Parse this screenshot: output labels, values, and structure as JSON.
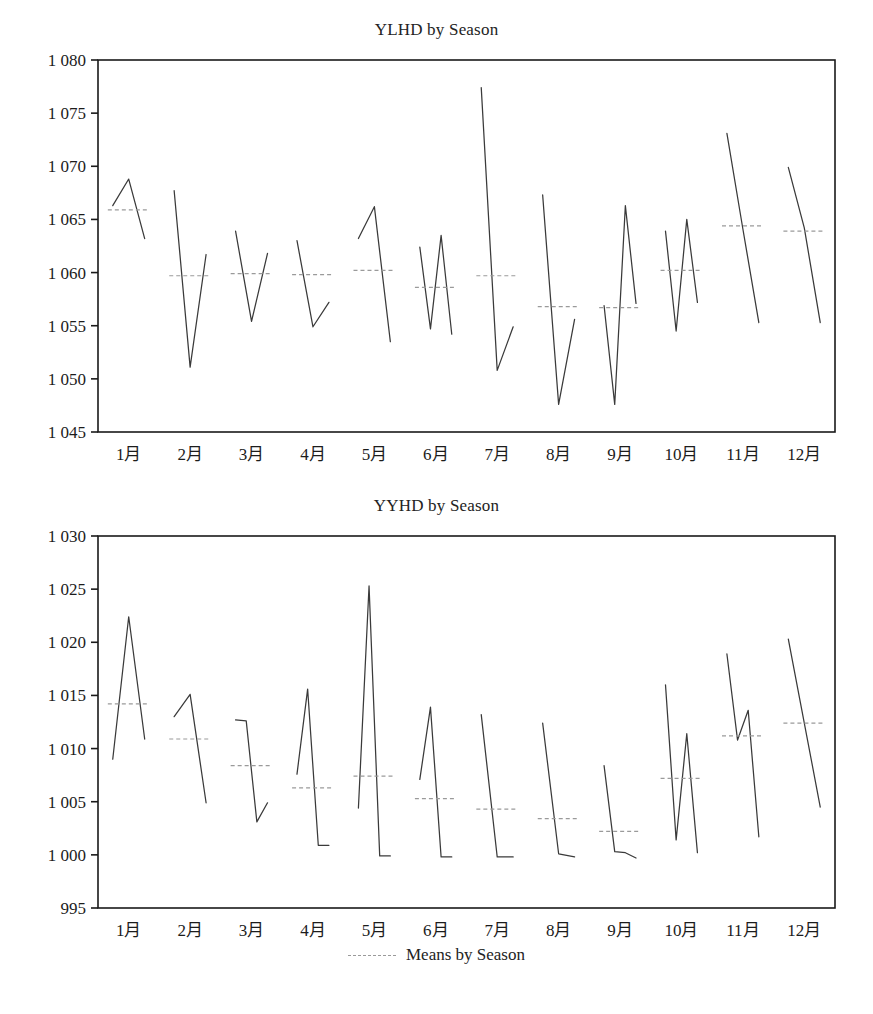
{
  "figure": {
    "legend_label": "Means by Season",
    "legend_swatch_name": "dashed-line-swatch",
    "series_color": "#3a3a3a",
    "mean_color": "#9a9a9a",
    "axis_color": "#1a1a1a",
    "background": "#ffffff"
  },
  "chart_data": [
    {
      "type": "line",
      "title": "YLHD by Season",
      "xlabel": "",
      "ylabel": "",
      "grid": false,
      "legend_position": "bottom",
      "legend_entries": [
        "Means by Season"
      ],
      "categories": [
        "1月",
        "2月",
        "3月",
        "4月",
        "5月",
        "6月",
        "7月",
        "8月",
        "9月",
        "10月",
        "11月",
        "12月"
      ],
      "ylim": [
        1045,
        1080
      ],
      "yticks": [
        1045,
        1050,
        1055,
        1060,
        1065,
        1070,
        1075,
        1080
      ],
      "ytick_labels": [
        "1 045",
        "1 050",
        "1 055",
        "1 060",
        "1 065",
        "1 070",
        "1 075",
        "1 080"
      ],
      "groups": [
        {
          "category": "1月",
          "values": [
            1066.3,
            1068.8,
            1063.2
          ],
          "mean": 1065.9
        },
        {
          "category": "2月",
          "values": [
            1067.7,
            1051.1,
            1061.7
          ],
          "mean": 1059.7
        },
        {
          "category": "3月",
          "values": [
            1063.9,
            1055.4,
            1061.8
          ],
          "mean": 1059.9
        },
        {
          "category": "4月",
          "values": [
            1063.0,
            1054.9,
            1057.2
          ],
          "mean": 1059.8
        },
        {
          "category": "5月",
          "values": [
            1063.2,
            1066.2,
            1053.5
          ],
          "mean": 1060.2
        },
        {
          "category": "6月",
          "values": [
            1062.4,
            1054.7,
            1063.5,
            1054.2
          ],
          "mean": 1058.6
        },
        {
          "category": "7月",
          "values": [
            1077.4,
            1050.8,
            1054.9
          ],
          "mean": 1059.7
        },
        {
          "category": "8月",
          "values": [
            1067.3,
            1047.6,
            1055.6
          ],
          "mean": 1056.8
        },
        {
          "category": "9月",
          "values": [
            1056.9,
            1047.6,
            1066.3,
            1057.1
          ],
          "mean": 1056.7
        },
        {
          "category": "10月",
          "values": [
            1063.9,
            1054.5,
            1065.0,
            1057.2
          ],
          "mean": 1060.2
        },
        {
          "category": "11月",
          "values": [
            1073.1,
            1064.1,
            1055.3
          ],
          "mean": 1064.4
        },
        {
          "category": "12月",
          "values": [
            1069.9,
            1064.2,
            1055.3
          ],
          "mean": 1063.9
        }
      ]
    },
    {
      "type": "line",
      "title": "YYHD by Season",
      "xlabel": "",
      "ylabel": "",
      "grid": false,
      "legend_position": "bottom",
      "legend_entries": [
        "Means by Season"
      ],
      "categories": [
        "1月",
        "2月",
        "3月",
        "4月",
        "5月",
        "6月",
        "7月",
        "8月",
        "9月",
        "10月",
        "11月",
        "12月"
      ],
      "ylim": [
        995,
        1030
      ],
      "yticks": [
        995,
        1000,
        1005,
        1010,
        1015,
        1020,
        1025,
        1030
      ],
      "ytick_labels": [
        "995",
        "1 000",
        "1 005",
        "1 010",
        "1 015",
        "1 020",
        "1 025",
        "1 030"
      ],
      "groups": [
        {
          "category": "1月",
          "values": [
            1009.0,
            1022.4,
            1010.9
          ],
          "mean": 1014.2
        },
        {
          "category": "2月",
          "values": [
            1013.0,
            1015.1,
            1004.9
          ],
          "mean": 1010.9
        },
        {
          "category": "3月",
          "values": [
            1012.7,
            1012.6,
            1003.1,
            1004.9
          ],
          "mean": 1008.4
        },
        {
          "category": "4月",
          "values": [
            1007.6,
            1015.6,
            1000.9,
            1000.9
          ],
          "mean": 1006.3
        },
        {
          "category": "5月",
          "values": [
            1004.4,
            1025.3,
            999.9,
            999.9
          ],
          "mean": 1007.4
        },
        {
          "category": "6月",
          "values": [
            1007.1,
            1013.9,
            999.8,
            999.8
          ],
          "mean": 1005.3
        },
        {
          "category": "7月",
          "values": [
            1013.2,
            999.8,
            999.8
          ],
          "mean": 1004.3
        },
        {
          "category": "8月",
          "values": [
            1012.4,
            1000.1,
            999.8
          ],
          "mean": 1003.4
        },
        {
          "category": "9月",
          "values": [
            1008.4,
            1000.3,
            1000.2,
            999.7
          ],
          "mean": 1002.2
        },
        {
          "category": "10月",
          "values": [
            1016.0,
            1001.4,
            1011.4,
            1000.2
          ],
          "mean": 1007.2
        },
        {
          "category": "11月",
          "values": [
            1018.9,
            1010.8,
            1013.6,
            1001.7
          ],
          "mean": 1011.2
        },
        {
          "category": "12月",
          "values": [
            1020.3,
            1004.5
          ],
          "mean": 1012.4
        }
      ]
    }
  ]
}
